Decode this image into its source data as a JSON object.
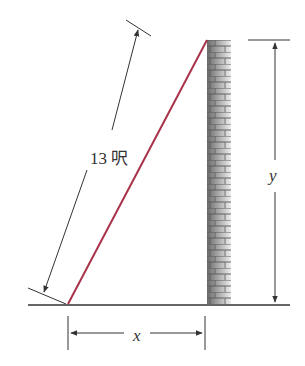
{
  "diagram": {
    "labels": {
      "ladder_length": "13 呎",
      "horizontal_distance": "x",
      "height": "y"
    },
    "colors": {
      "ladder": "#a8324a",
      "lines": "#333333",
      "wall_dark": "#6f6f6f",
      "wall_light": "#e6e6e6"
    }
  }
}
